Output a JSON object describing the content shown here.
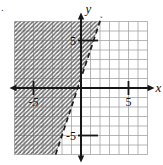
{
  "figure": {
    "corner_mark": ".",
    "background": "#ffffff"
  },
  "chart_data": {
    "type": "line",
    "xlabel": "x",
    "ylabel": "y",
    "xlim": [
      -7,
      7
    ],
    "ylim": [
      -7,
      7
    ],
    "grid": true,
    "grid_step": 1,
    "grid_color": "#9e9e9e",
    "axis_color": "#161616",
    "x_tick_labels": [
      {
        "value": -5,
        "label": "-5",
        "italic": true
      },
      {
        "value": 5,
        "label": "5",
        "italic": false
      }
    ],
    "y_tick_labels": [
      {
        "value": 5,
        "label": "5",
        "italic": false
      },
      {
        "value": -5,
        "label": "-5",
        "italic": false
      }
    ],
    "boundary_line": {
      "equation": "y = 3x + 1",
      "slope": 3,
      "intercept": 1,
      "style": "dashed",
      "color": "#1c1c1c",
      "points": [
        {
          "x": -2.67,
          "y": -7.0
        },
        {
          "x": 2.16,
          "y": 7.5
        }
      ]
    },
    "shaded_region": {
      "inequality": "y > 3x + 1",
      "side": "left-of-line",
      "pattern": "diagonal-hatch",
      "hatch_direction": "/",
      "hatch_color": "#6a6a6a",
      "hatch_spacing": 4.2
    }
  }
}
